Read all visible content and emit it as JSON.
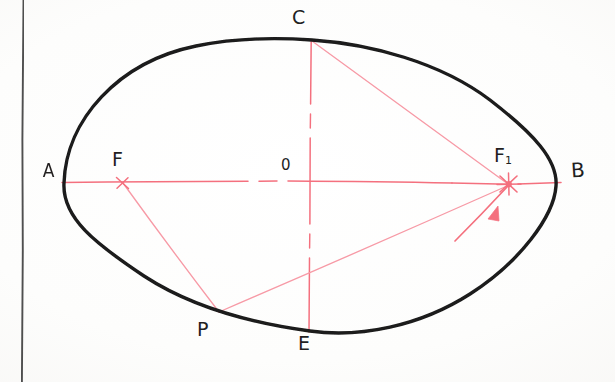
{
  "document": {
    "kind": "hand-drawn-geometry-diagram",
    "subject": "ellipse-with-foci-construction",
    "background_color": "#fdfdfc",
    "margin_rule_color": "#3c3c3c"
  },
  "colors": {
    "curve": "#1a1a1a",
    "construction": "#f4707e",
    "construction_light": "#f79aa6",
    "label": "#221f1f",
    "margin_line": "#3f3f3f"
  },
  "labels": {
    "vertex_left": "A",
    "vertex_right": "B",
    "covertex_top": "C",
    "covertex_bottom": "E",
    "center": "0",
    "focus_left": "F",
    "focus_right_main": "F",
    "focus_right_sub": "1",
    "point_on_curve": "P"
  },
  "geometry": {
    "ellipse": {
      "center_x": 310,
      "center_y": 186,
      "semi_major": 246,
      "semi_minor": 146,
      "stroke_width": 3.4
    },
    "points": {
      "A": {
        "x": 64,
        "y": 183
      },
      "B": {
        "x": 556,
        "y": 181
      },
      "C": {
        "x": 311,
        "y": 40
      },
      "E": {
        "x": 309,
        "y": 330
      },
      "O": {
        "x": 302,
        "y": 181
      },
      "F": {
        "x": 122,
        "y": 181
      },
      "F1": {
        "x": 509,
        "y": 184
      },
      "P": {
        "x": 219,
        "y": 312
      }
    },
    "axis_horizontal": {
      "x1": 62,
      "y1": 181,
      "x2": 560,
      "y2": 182,
      "style": "dash-dot"
    },
    "axis_vertical": {
      "x1": 311,
      "y1": 40,
      "x2": 309,
      "y2": 332,
      "style": "dash-dot"
    },
    "segments": [
      {
        "name": "C-to-F1",
        "from": "C",
        "to": "F1",
        "style": "solid"
      },
      {
        "name": "F-to-P",
        "from": "F",
        "to": "P",
        "style": "solid"
      },
      {
        "name": "P-to-F1",
        "from": "P",
        "to": "F1",
        "style": "solid"
      }
    ],
    "arrows": [
      {
        "name": "incoming-ray-to-focus",
        "x1": 456,
        "y1": 240,
        "x2": 508,
        "y2": 186
      }
    ],
    "markers": {
      "focus_left_marker": "cross-marker",
      "focus_right_marker": "star-burst-marker"
    }
  },
  "margin_rule": {
    "x": 22,
    "y1": 0,
    "y2": 382
  }
}
